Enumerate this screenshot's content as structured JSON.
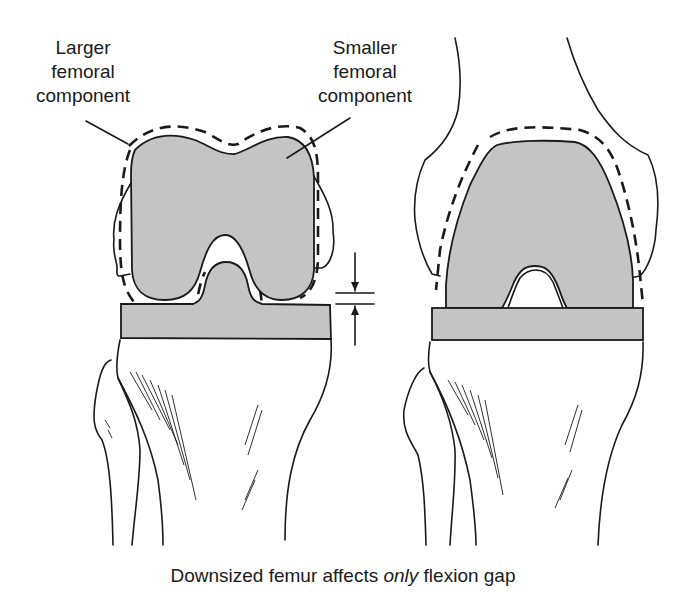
{
  "diagram": {
    "labels": {
      "larger_line1": "Larger",
      "larger_line2": "femoral",
      "larger_line3": "component",
      "smaller_line1": "Smaller",
      "smaller_line2": "femoral",
      "smaller_line3": "component"
    },
    "caption": {
      "before": "Downsized femur affects ",
      "emphasis": "only",
      "after": " flexion gap"
    },
    "panels": [
      {
        "name": "left-knee",
        "view": "anterior view, flexion gap shown with arrows"
      },
      {
        "name": "right-knee",
        "view": "anterior view with distal femur shaft"
      }
    ],
    "colors": {
      "component_fill": "#c4c4c4",
      "line": "#1a1a1a",
      "background": "#ffffff"
    }
  }
}
